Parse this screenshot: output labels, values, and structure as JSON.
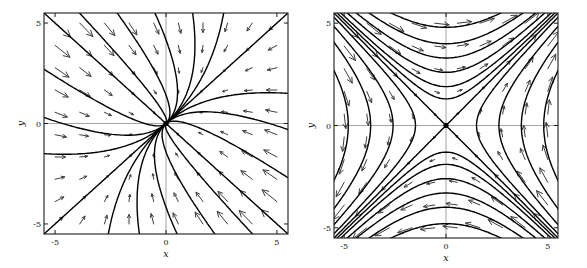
{
  "figure": {
    "caption": "",
    "background": "#ffffff"
  },
  "chart_data": [
    {
      "type": "phase-portrait",
      "portrait": "stable node (sink), eigendirections y=x and y=-x",
      "xlabel": "x",
      "ylabel": "y",
      "xlim": [
        -5.5,
        5.5
      ],
      "ylim": [
        -5.5,
        5.5
      ],
      "xticks": [
        -5,
        0,
        5
      ],
      "yticks": [
        -5,
        0,
        5
      ],
      "grid": false,
      "equilibrium": [
        0,
        0
      ],
      "system_matrix": [
        [
          -1.5,
          0.5
        ],
        [
          0.5,
          -1.5
        ]
      ],
      "arrow_grid": {
        "n": 10,
        "min": -5,
        "max": 5,
        "scale": 0.9
      },
      "seeds": [
        {
          "p": [
            -5.5,
            5.5
          ],
          "mode": "forward"
        },
        {
          "p": [
            5.5,
            -5.5
          ],
          "mode": "forward"
        },
        {
          "p": [
            5.5,
            5.5
          ],
          "mode": "forward"
        },
        {
          "p": [
            -5.5,
            -5.5
          ],
          "mode": "forward"
        },
        {
          "p": [
            -3.9,
            5.5
          ],
          "mode": "forward"
        },
        {
          "p": [
            -2.2,
            5.5
          ],
          "mode": "forward"
        },
        {
          "p": [
            -0.5,
            5.5
          ],
          "mode": "forward"
        },
        {
          "p": [
            1.2,
            5.5
          ],
          "mode": "forward"
        },
        {
          "p": [
            2.6,
            5.5
          ],
          "mode": "forward"
        },
        {
          "p": [
            3.9,
            -5.5
          ],
          "mode": "forward"
        },
        {
          "p": [
            2.2,
            -5.5
          ],
          "mode": "forward"
        },
        {
          "p": [
            0.5,
            -5.5
          ],
          "mode": "forward"
        },
        {
          "p": [
            -1.2,
            -5.5
          ],
          "mode": "forward"
        },
        {
          "p": [
            -2.6,
            -5.5
          ],
          "mode": "forward"
        },
        {
          "p": [
            -5.5,
            2.7
          ],
          "mode": "forward"
        },
        {
          "p": [
            -5.5,
            0.3
          ],
          "mode": "forward"
        },
        {
          "p": [
            -5.5,
            -1.5
          ],
          "mode": "forward"
        },
        {
          "p": [
            5.5,
            -2.7
          ],
          "mode": "forward"
        },
        {
          "p": [
            5.5,
            -0.3
          ],
          "mode": "forward"
        },
        {
          "p": [
            5.5,
            1.5
          ],
          "mode": "forward"
        }
      ],
      "colors": {
        "trajectory": "#000000",
        "arrow": "#3d3d3d",
        "axis": "#9a9a9a",
        "frame": "#1c1c1c",
        "text": "#111111",
        "dot": "#000000"
      }
    },
    {
      "type": "phase-portrait",
      "portrait": "saddle point, separatrices y=x (unstable) and y=-x (stable)",
      "xlabel": "x",
      "ylabel": "y",
      "xlim": [
        -5.5,
        5.5
      ],
      "ylim": [
        -5.5,
        5.5
      ],
      "xticks": [
        -5,
        0,
        5
      ],
      "yticks": [
        -5,
        0,
        5
      ],
      "grid": false,
      "equilibrium": [
        0,
        0
      ],
      "system_matrix": [
        [
          0,
          1
        ],
        [
          1,
          0
        ]
      ],
      "arrow_grid": {
        "n": 10,
        "min": -5,
        "max": 5,
        "scale": 0.9
      },
      "seeds": [
        {
          "p": [
            0.06,
            0.06
          ],
          "mode": "forward"
        },
        {
          "p": [
            -0.06,
            -0.06
          ],
          "mode": "forward"
        },
        {
          "p": [
            2,
            -2
          ],
          "mode": "both"
        },
        {
          "p": [
            -2,
            2
          ],
          "mode": "both"
        },
        {
          "p": [
            0,
            1.3
          ],
          "mode": "both"
        },
        {
          "p": [
            0,
            1.9
          ],
          "mode": "both"
        },
        {
          "p": [
            0,
            2.6
          ],
          "mode": "both"
        },
        {
          "p": [
            0,
            3.3
          ],
          "mode": "both"
        },
        {
          "p": [
            0,
            4.0
          ],
          "mode": "both"
        },
        {
          "p": [
            0,
            4.8
          ],
          "mode": "both"
        },
        {
          "p": [
            0,
            -1.3
          ],
          "mode": "both"
        },
        {
          "p": [
            0,
            -1.9
          ],
          "mode": "both"
        },
        {
          "p": [
            0,
            -2.6
          ],
          "mode": "both"
        },
        {
          "p": [
            0,
            -3.3
          ],
          "mode": "both"
        },
        {
          "p": [
            0,
            -4.0
          ],
          "mode": "both"
        },
        {
          "p": [
            0,
            -4.8
          ],
          "mode": "both"
        },
        {
          "p": [
            -1.5,
            0
          ],
          "mode": "both"
        },
        {
          "p": [
            -2.6,
            0
          ],
          "mode": "both"
        },
        {
          "p": [
            -3.7,
            0
          ],
          "mode": "both"
        },
        {
          "p": [
            -4.8,
            0
          ],
          "mode": "both"
        },
        {
          "p": [
            1.5,
            0
          ],
          "mode": "both"
        },
        {
          "p": [
            2.6,
            0
          ],
          "mode": "both"
        },
        {
          "p": [
            3.7,
            0
          ],
          "mode": "both"
        },
        {
          "p": [
            4.8,
            0
          ],
          "mode": "both"
        }
      ],
      "colors": {
        "trajectory": "#000000",
        "arrow": "#3d3d3d",
        "axis": "#9a9a9a",
        "frame": "#1c1c1c",
        "text": "#111111",
        "dot": "#000000"
      }
    }
  ]
}
